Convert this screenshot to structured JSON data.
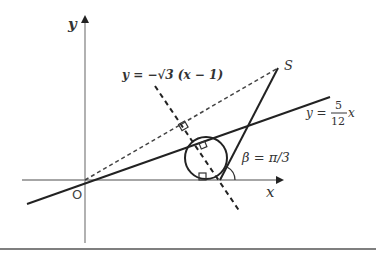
{
  "diagram": {
    "type": "geometry",
    "axes": {
      "x_label": "x",
      "y_label": "y",
      "origin_label": "O"
    },
    "lines": [
      {
        "name": "line-5-12",
        "equation_lhs": "y =",
        "frac_num": "5",
        "frac_den": "12",
        "equation_rhs_var": "x",
        "style": "solid"
      },
      {
        "name": "perpendicular-line",
        "equation": "y = −√3 (x − 1)",
        "style": "dashed"
      },
      {
        "name": "line-OS",
        "style": "dashed"
      },
      {
        "name": "line-S-to-x-axis",
        "style": "solid"
      }
    ],
    "points": [
      {
        "label": "S"
      },
      {
        "label": "O"
      }
    ],
    "angle": {
      "label": "β = π/3"
    },
    "circle": {
      "description": "incircle tangent to x-axis, line y=5/12x and line through S"
    },
    "colors": {
      "axis": "#888888",
      "line": "#222222",
      "label": "#333333",
      "rule": "#555555"
    }
  }
}
